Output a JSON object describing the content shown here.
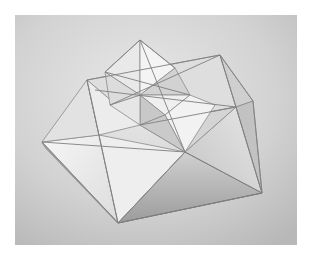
{
  "image": {
    "subject": "geometric paper sculpture of stacked square pyramids forming a star pattern",
    "style": "grayscale photograph",
    "colors": {
      "border": "#ffffff",
      "background_light": "#e4e4e4",
      "background_dark": "#b5b5b5",
      "face_light": "#f2f2f2",
      "face_mid": "#d9d9d9",
      "face_shadow": "#a8a8a8",
      "edge": "#8a8a8a",
      "cast_shadow": "#5a5a5a"
    }
  }
}
